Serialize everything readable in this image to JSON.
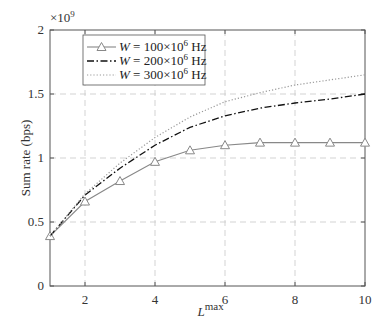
{
  "chart_data": {
    "type": "line",
    "title": "",
    "xlabel": "L^max",
    "xlabel_base": "L",
    "xlabel_sup": "max",
    "ylabel": "Sum rate (bps)",
    "y_multiplier": "×10",
    "y_multiplier_exp": "9",
    "xlim": [
      1,
      10
    ],
    "ylim": [
      0,
      2
    ],
    "x_ticks": [
      "2",
      "4",
      "6",
      "8",
      "10"
    ],
    "y_ticks": [
      "0",
      "0.5",
      "1",
      "1.5",
      "2"
    ],
    "grid": true,
    "legend_position": "upper left",
    "x": [
      1,
      2,
      3,
      4,
      5,
      6,
      7,
      8,
      9,
      10
    ],
    "series": [
      {
        "name": "W = 100×10^6 Hz",
        "label_pre": "W = 100×10",
        "label_exp": "6",
        "label_unit": " Hz",
        "style": "solid-triangle",
        "values": [
          0.39,
          0.66,
          0.82,
          0.97,
          1.06,
          1.1,
          1.12,
          1.12,
          1.12,
          1.12
        ]
      },
      {
        "name": "W = 200×10^6 Hz",
        "label_pre": "W = 200×10",
        "label_exp": "6",
        "label_unit": " Hz",
        "style": "dashdot",
        "values": [
          0.39,
          0.71,
          0.92,
          1.1,
          1.24,
          1.33,
          1.39,
          1.43,
          1.46,
          1.5
        ]
      },
      {
        "name": "W = 300×10^6 Hz",
        "label_pre": "W = 300×10",
        "label_exp": "6",
        "label_unit": " Hz",
        "style": "dotted",
        "values": [
          0.39,
          0.72,
          0.96,
          1.16,
          1.32,
          1.44,
          1.51,
          1.57,
          1.61,
          1.65
        ]
      }
    ]
  }
}
